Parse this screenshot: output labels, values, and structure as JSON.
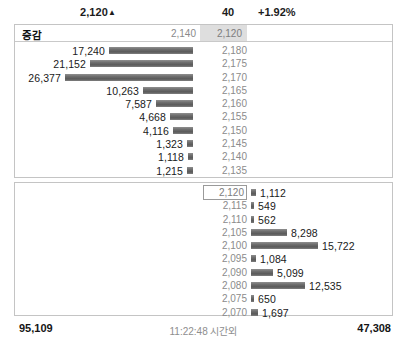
{
  "quote": {
    "current_price": "2,120",
    "direction_icon": "up-triangle",
    "direction_glyph": "▲",
    "change": "40",
    "change_percent": "+1.92%"
  },
  "header": {
    "label": "증감",
    "prev_price": "2,140",
    "current_price": "2,120"
  },
  "ask_rows": [
    {
      "volume": "17,240",
      "price": "2,180",
      "value": 17240
    },
    {
      "volume": "21,152",
      "price": "2,175",
      "value": 21152
    },
    {
      "volume": "26,377",
      "price": "2,170",
      "value": 26377
    },
    {
      "volume": "10,263",
      "price": "2,165",
      "value": 10263
    },
    {
      "volume": "7,587",
      "price": "2,160",
      "value": 7587
    },
    {
      "volume": "4,668",
      "price": "2,155",
      "value": 4668
    },
    {
      "volume": "4,116",
      "price": "2,150",
      "value": 4116
    },
    {
      "volume": "1,323",
      "price": "2,145",
      "value": 1323
    },
    {
      "volume": "1,118",
      "price": "2,140",
      "value": 1118
    },
    {
      "volume": "1,215",
      "price": "2,135",
      "value": 1215
    }
  ],
  "bid_rows": [
    {
      "price": "2,120",
      "volume": "1,112",
      "value": 1112,
      "boxed": true
    },
    {
      "price": "2,115",
      "volume": "549",
      "value": 549,
      "boxed": false
    },
    {
      "price": "2,110",
      "volume": "562",
      "value": 562,
      "boxed": false
    },
    {
      "price": "2,105",
      "volume": "8,298",
      "value": 8298,
      "boxed": false
    },
    {
      "price": "2,100",
      "volume": "15,722",
      "value": 15722,
      "boxed": false
    },
    {
      "price": "2,095",
      "volume": "1,084",
      "value": 1084,
      "boxed": false
    },
    {
      "price": "2,090",
      "volume": "5,099",
      "value": 5099,
      "boxed": false
    },
    {
      "price": "2,080",
      "volume": "12,535",
      "value": 12535,
      "boxed": false
    },
    {
      "price": "2,075",
      "volume": "650",
      "value": 650,
      "boxed": false
    },
    {
      "price": "2,070",
      "volume": "1,697",
      "value": 1697,
      "boxed": false
    }
  ],
  "footer": {
    "total_ask": "95,109",
    "time_label": "11:22:48 시간외",
    "total_bid": "47,308"
  },
  "chart_data": {
    "type": "bar",
    "orientation": "horizontal",
    "series": [
      {
        "name": "ask_volume",
        "direction": "left",
        "categories": [
          "2,180",
          "2,175",
          "2,170",
          "2,165",
          "2,160",
          "2,155",
          "2,150",
          "2,145",
          "2,140",
          "2,135"
        ],
        "values": [
          17240,
          21152,
          26377,
          10263,
          7587,
          4668,
          4116,
          1323,
          1118,
          1215
        ]
      },
      {
        "name": "bid_volume",
        "direction": "right",
        "categories": [
          "2,120",
          "2,115",
          "2,110",
          "2,105",
          "2,100",
          "2,095",
          "2,090",
          "2,080",
          "2,075",
          "2,070"
        ],
        "values": [
          1112,
          549,
          562,
          8298,
          15722,
          1084,
          5099,
          12535,
          650,
          1697
        ]
      }
    ],
    "xlabel": "",
    "ylabel": "price",
    "max_value": 26377,
    "grid": false,
    "legend": "none",
    "bar_color": "#666666"
  },
  "scale": {
    "ask_max_width_px": 128,
    "bid_max_width_px": 113,
    "max_volume": 26377
  }
}
